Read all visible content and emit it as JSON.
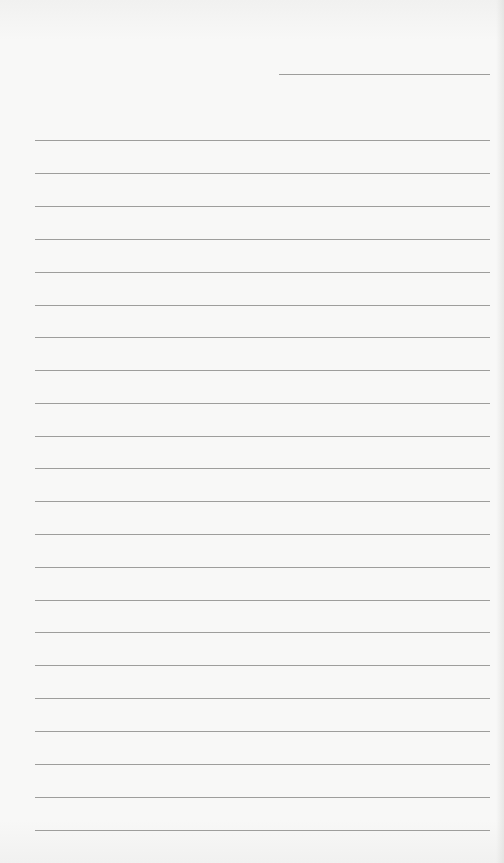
{
  "page": {
    "type": "lined-paper",
    "background_color": "#f7f7f6",
    "rule_color": "#8e8e8c"
  },
  "header_line": {
    "x1": 279,
    "x2": 490,
    "y": 74
  },
  "rules": {
    "x1": 35,
    "x2": 490,
    "y_positions": [
      140,
      173,
      206,
      239,
      272,
      305,
      337,
      370,
      403,
      436,
      468,
      501,
      534,
      567,
      600,
      632,
      665,
      698,
      731,
      764,
      797,
      830
    ]
  }
}
